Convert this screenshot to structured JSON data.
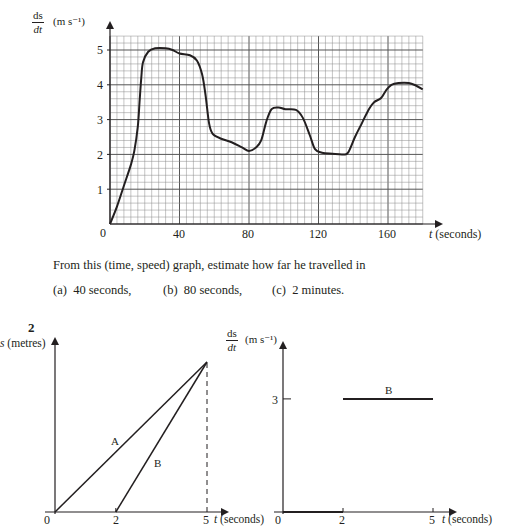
{
  "chart_data": [
    {
      "type": "line",
      "title": "",
      "xlabel": "t (seconds)",
      "ylabel": "ds/dt (m s^-1)",
      "ylabel_parts": {
        "num": "ds",
        "den": "dt",
        "unit": "(m s⁻¹)"
      },
      "xlim": [
        0,
        180
      ],
      "ylim": [
        0,
        5.4
      ],
      "x_ticks": [
        0,
        40,
        80,
        120,
        160
      ],
      "y_ticks": [
        1,
        2,
        3,
        4,
        5
      ],
      "grid": {
        "on": true,
        "minor_x_step": 4,
        "minor_y_step": 0.2,
        "major_x_step": 40,
        "major_y_step": 1
      },
      "legend": null,
      "series": [
        {
          "name": "speed",
          "points": [
            [
              0,
              0
            ],
            [
              4,
              0.5
            ],
            [
              8,
              1.1
            ],
            [
              12,
              1.7
            ],
            [
              14,
              2.1
            ],
            [
              16,
              2.8
            ],
            [
              17,
              3.5
            ],
            [
              18,
              4.2
            ],
            [
              19,
              4.65
            ],
            [
              22,
              4.95
            ],
            [
              26,
              5.05
            ],
            [
              32,
              5.05
            ],
            [
              36,
              5.0
            ],
            [
              40,
              4.9
            ],
            [
              46,
              4.85
            ],
            [
              50,
              4.7
            ],
            [
              53,
              4.3
            ],
            [
              55,
              3.7
            ],
            [
              57,
              2.9
            ],
            [
              59,
              2.6
            ],
            [
              64,
              2.45
            ],
            [
              70,
              2.35
            ],
            [
              76,
              2.2
            ],
            [
              80,
              2.1
            ],
            [
              84,
              2.2
            ],
            [
              87,
              2.4
            ],
            [
              90,
              2.95
            ],
            [
              93,
              3.3
            ],
            [
              97,
              3.35
            ],
            [
              101,
              3.3
            ],
            [
              107,
              3.28
            ],
            [
              111,
              3.05
            ],
            [
              115,
              2.55
            ],
            [
              118,
              2.15
            ],
            [
              122,
              2.05
            ],
            [
              128,
              2.02
            ],
            [
              134,
              2.0
            ],
            [
              137,
              2.05
            ],
            [
              141,
              2.5
            ],
            [
              145,
              2.9
            ],
            [
              149,
              3.3
            ],
            [
              152,
              3.5
            ],
            [
              156,
              3.62
            ],
            [
              159,
              3.85
            ],
            [
              162,
              4.0
            ],
            [
              166,
              4.05
            ],
            [
              172,
              4.05
            ],
            [
              176,
              3.98
            ],
            [
              180,
              3.87
            ]
          ]
        }
      ]
    },
    {
      "type": "line",
      "title": "",
      "xlabel": "t (seconds)",
      "ylabel": "s (metres)",
      "xlim": [
        0,
        5
      ],
      "x_ticks": [
        0,
        2,
        5
      ],
      "grid": {
        "on": false
      },
      "series": [
        {
          "name": "A",
          "points": [
            [
              0,
              0
            ],
            [
              5,
              1
            ]
          ]
        },
        {
          "name": "B",
          "points": [
            [
              2,
              0
            ],
            [
              5,
              1
            ]
          ]
        }
      ],
      "annotations": [
        "dashed vertical line at t = 5"
      ]
    },
    {
      "type": "line",
      "title": "",
      "xlabel": "t (seconds)",
      "ylabel": "ds/dt (m s^-1)",
      "ylabel_parts": {
        "num": "ds",
        "den": "dt",
        "unit": "(m s⁻¹)"
      },
      "xlim": [
        0,
        5
      ],
      "x_ticks": [
        0,
        2,
        5
      ],
      "y_ticks": [
        3
      ],
      "grid": {
        "on": false
      },
      "series": [
        {
          "name": "B",
          "points": [
            [
              0,
              0
            ],
            [
              2,
              0
            ],
            [
              2,
              3
            ],
            [
              5,
              3
            ]
          ],
          "segments": [
            [
              [
                0,
                0
              ],
              [
                2,
                0
              ]
            ],
            [
              [
                2,
                3
              ],
              [
                5,
                3
              ]
            ]
          ]
        }
      ]
    }
  ],
  "graph1": {
    "y_num": "ds",
    "y_den": "dt",
    "y_unit": "(m s⁻¹)",
    "x_label_var": "t",
    "x_label_unit": "(seconds)",
    "origin": "0",
    "x_ticks": [
      "40",
      "80",
      "120",
      "160"
    ],
    "y_ticks": [
      "1",
      "2",
      "3",
      "4",
      "5"
    ]
  },
  "question": {
    "prompt": "From this (time, speed) graph, estimate how far he travelled in",
    "parts": [
      {
        "label": "(a)",
        "text": "40 seconds,"
      },
      {
        "label": "(b)",
        "text": "80 seconds,"
      },
      {
        "label": "(c)",
        "text": "2 minutes."
      }
    ]
  },
  "question2": {
    "number": "2",
    "left_graph": {
      "y_var": "s",
      "y_unit": "(metres)",
      "x_var": "t",
      "x_unit": "(seconds)",
      "origin": "0",
      "x_ticks": [
        "2",
        "5"
      ],
      "line_labels": [
        "A",
        "B"
      ]
    },
    "right_graph": {
      "y_num": "ds",
      "y_den": "dt",
      "y_unit": "(m s⁻¹)",
      "x_var": "t",
      "x_unit": "(seconds)",
      "origin": "0",
      "x_ticks": [
        "2",
        "5"
      ],
      "y_tick": "3",
      "line_label": "B"
    }
  },
  "colors": {
    "ink": "#231f20",
    "grid": "#8a8a8a",
    "grid_major": "#555555"
  }
}
